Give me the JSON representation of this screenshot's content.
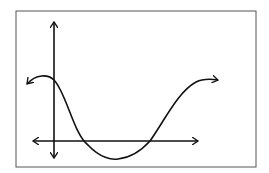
{
  "diagram": {
    "type": "function-graph-sketch",
    "colors": {
      "stroke": "#111111",
      "frame": "#555555",
      "background": "#ffffff"
    },
    "frame": {
      "x": 16,
      "y": 11,
      "width": 240,
      "height": 156
    },
    "y_axis": {
      "x": 54,
      "y_top": 22,
      "y_bottom": 158
    },
    "x_axis": {
      "y": 141,
      "x_left": 33,
      "x_right": 198
    },
    "curve_path": "M27,84 C36,74 48,74 54,80 C66,92 74,135 88,145 C100,158 112,160 118,159 C128,158 140,152 150,141 C166,118 178,92 196,82 C204,78 212,79 218,80"
  }
}
